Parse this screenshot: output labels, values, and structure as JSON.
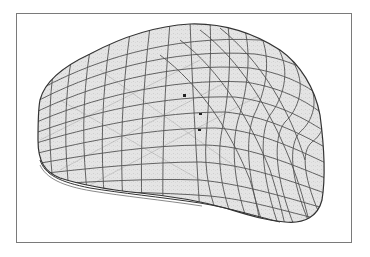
{
  "figure": {
    "description": "Grayscale 3D wireframe mesh rendering of a rounded, lumpy blob-like object (e.g. an organ or bone surface) inside a thin gray rectangular frame",
    "frame_color": "#7a7a7a",
    "surface_fill": "#e2e2e2",
    "mesh_line_color": "#3a3a3a",
    "background": "#ffffff"
  }
}
